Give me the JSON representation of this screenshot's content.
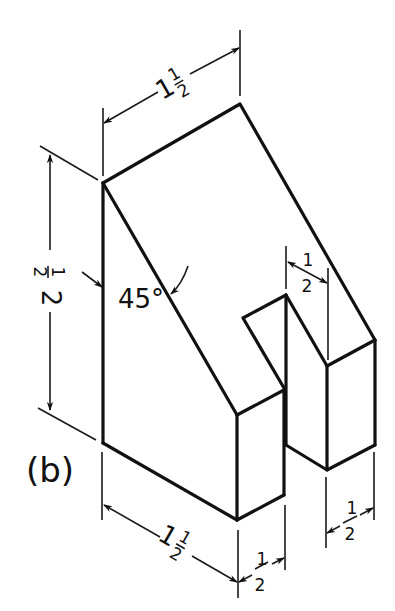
{
  "figure": {
    "caption": "(b)",
    "colors": {
      "line": "#111111",
      "background": "#ffffff"
    }
  },
  "dimensions": {
    "top_width": {
      "whole": "1",
      "num": "1",
      "den": "2",
      "value": "1 1/2"
    },
    "height": {
      "whole": "2",
      "num": "1",
      "den": "2",
      "value": "2 1/2"
    },
    "angle": {
      "value": "45°"
    },
    "slot_width": {
      "num": "1",
      "den": "2",
      "value": "1/2"
    },
    "bottom_length": {
      "whole": "1",
      "num": "1",
      "den": "2",
      "value": "1 1/2"
    },
    "bottom_depth": {
      "num": "1",
      "den": "2",
      "value": "1/2"
    },
    "right_depth": {
      "num": "1",
      "den": "2",
      "value": "1/2"
    }
  }
}
